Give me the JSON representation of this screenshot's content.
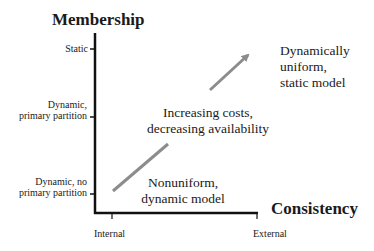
{
  "diagram": {
    "y_axis_title": "Membership",
    "x_axis_title": "Consistency",
    "y_ticks": [
      {
        "label_lines": [
          "Static"
        ]
      },
      {
        "label_lines": [
          "Dynamic,",
          "primary partition"
        ]
      },
      {
        "label_lines": [
          "Dynamic, no",
          "primary partition"
        ]
      }
    ],
    "x_ticks": [
      "Internal",
      "External"
    ],
    "regions": {
      "top_right": [
        "Dynamically",
        "uniform,",
        "static model"
      ],
      "middle": [
        "Increasing costs,",
        "decreasing availability"
      ],
      "bottom": [
        "Nonuniform,",
        "dynamic model"
      ]
    },
    "arrow": {
      "direction": "up-right",
      "color": "#8c8c8c"
    },
    "axis_color": "#111111"
  }
}
